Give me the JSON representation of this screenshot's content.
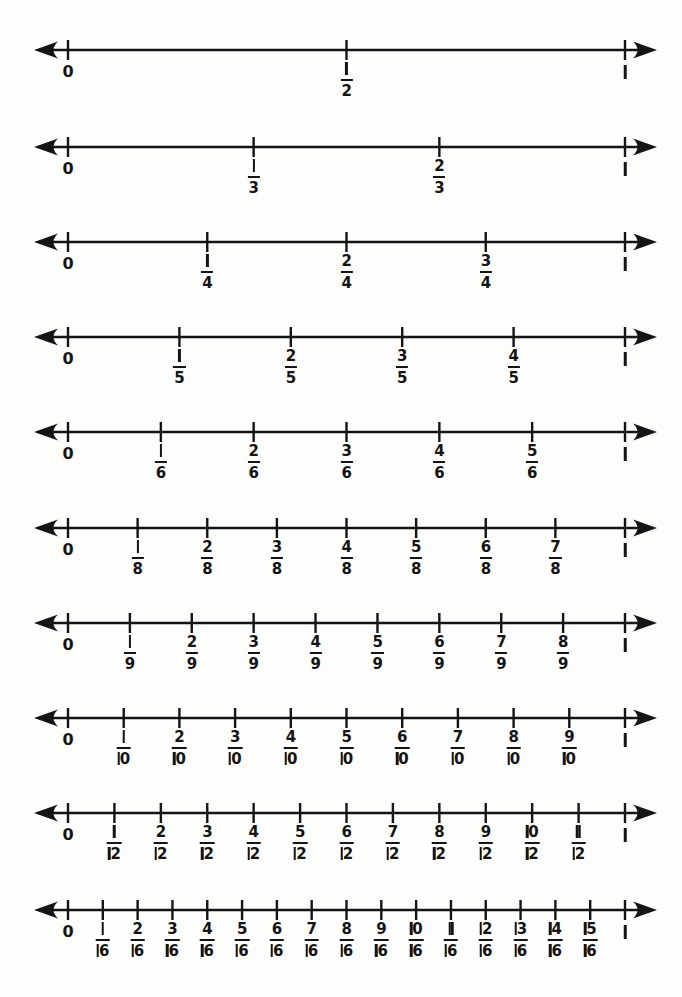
{
  "page": {
    "background_color": "#fdfdfc",
    "ink_color": "#141414",
    "width": 682,
    "height": 997
  },
  "axis": {
    "zero_label": "0",
    "one_label": "1",
    "left_arrow": "arrow-left",
    "right_arrow": "arrow-right",
    "x_zero": 68,
    "x_one": 625,
    "left_tip": 34,
    "right_tip": 657
  },
  "chart_data": {
    "type": "line",
    "xlabel": "",
    "ylabel": "",
    "xlim": [
      0,
      1
    ],
    "grid": false,
    "legend": null,
    "denominators": [
      2,
      3,
      4,
      5,
      6,
      8,
      9,
      10,
      12,
      16
    ],
    "rows": [
      {
        "denominator": 2,
        "row_index": 0,
        "axis_y": 50,
        "tick_values": [
          0,
          0.5,
          1
        ],
        "labels": [
          "0",
          "1/2",
          "1"
        ],
        "fractions": [
          {
            "numerator": "1",
            "denominator": "2",
            "value": 0.5
          }
        ]
      },
      {
        "denominator": 3,
        "row_index": 1,
        "axis_y": 147,
        "tick_values": [
          0,
          0.3333,
          0.6667,
          1
        ],
        "labels": [
          "0",
          "1/3",
          "2/3",
          "1"
        ],
        "fractions": [
          {
            "numerator": "1",
            "denominator": "3",
            "value": 0.3333
          },
          {
            "numerator": "2",
            "denominator": "3",
            "value": 0.6667
          }
        ]
      },
      {
        "denominator": 4,
        "row_index": 2,
        "axis_y": 242,
        "tick_values": [
          0,
          0.25,
          0.5,
          0.75,
          1
        ],
        "labels": [
          "0",
          "1/4",
          "2/4",
          "3/4",
          "1"
        ],
        "fractions": [
          {
            "numerator": "1",
            "denominator": "4",
            "value": 0.25
          },
          {
            "numerator": "2",
            "denominator": "4",
            "value": 0.5
          },
          {
            "numerator": "3",
            "denominator": "4",
            "value": 0.75
          }
        ]
      },
      {
        "denominator": 5,
        "row_index": 3,
        "axis_y": 337,
        "tick_values": [
          0,
          0.2,
          0.4,
          0.6,
          0.8,
          1
        ],
        "labels": [
          "0",
          "1/5",
          "2/5",
          "3/5",
          "4/5",
          "1"
        ],
        "fractions": [
          {
            "numerator": "1",
            "denominator": "5",
            "value": 0.2
          },
          {
            "numerator": "2",
            "denominator": "5",
            "value": 0.4
          },
          {
            "numerator": "3",
            "denominator": "5",
            "value": 0.6
          },
          {
            "numerator": "4",
            "denominator": "5",
            "value": 0.8
          }
        ]
      },
      {
        "denominator": 6,
        "row_index": 4,
        "axis_y": 432,
        "tick_values": [
          0,
          0.1667,
          0.3333,
          0.5,
          0.6667,
          0.8333,
          1
        ],
        "labels": [
          "0",
          "1/6",
          "2/6",
          "3/6",
          "4/6",
          "5/6",
          "1"
        ],
        "fractions": [
          {
            "numerator": "1",
            "denominator": "6",
            "value": 0.1667
          },
          {
            "numerator": "2",
            "denominator": "6",
            "value": 0.3333
          },
          {
            "numerator": "3",
            "denominator": "6",
            "value": 0.5
          },
          {
            "numerator": "4",
            "denominator": "6",
            "value": 0.6667
          },
          {
            "numerator": "5",
            "denominator": "6",
            "value": 0.8333
          }
        ]
      },
      {
        "denominator": 8,
        "row_index": 5,
        "axis_y": 528,
        "tick_values": [
          0,
          0.125,
          0.25,
          0.375,
          0.5,
          0.625,
          0.75,
          0.875,
          1
        ],
        "labels": [
          "0",
          "1/8",
          "2/8",
          "3/8",
          "4/8",
          "5/8",
          "6/8",
          "7/8",
          "1"
        ],
        "fractions": [
          {
            "numerator": "1",
            "denominator": "8",
            "value": 0.125
          },
          {
            "numerator": "2",
            "denominator": "8",
            "value": 0.25
          },
          {
            "numerator": "3",
            "denominator": "8",
            "value": 0.375
          },
          {
            "numerator": "4",
            "denominator": "8",
            "value": 0.5
          },
          {
            "numerator": "5",
            "denominator": "8",
            "value": 0.625
          },
          {
            "numerator": "6",
            "denominator": "8",
            "value": 0.75
          },
          {
            "numerator": "7",
            "denominator": "8",
            "value": 0.875
          }
        ]
      },
      {
        "denominator": 9,
        "row_index": 6,
        "axis_y": 623,
        "tick_values": [
          0,
          0.1111,
          0.2222,
          0.3333,
          0.4444,
          0.5556,
          0.6667,
          0.7778,
          0.8889,
          1
        ],
        "labels": [
          "0",
          "1/9",
          "2/9",
          "3/9",
          "4/9",
          "5/9",
          "6/9",
          "7/9",
          "8/9",
          "1"
        ],
        "fractions": [
          {
            "numerator": "1",
            "denominator": "9",
            "value": 0.1111
          },
          {
            "numerator": "2",
            "denominator": "9",
            "value": 0.2222
          },
          {
            "numerator": "3",
            "denominator": "9",
            "value": 0.3333
          },
          {
            "numerator": "4",
            "denominator": "9",
            "value": 0.4444
          },
          {
            "numerator": "5",
            "denominator": "9",
            "value": 0.5556
          },
          {
            "numerator": "6",
            "denominator": "9",
            "value": 0.6667
          },
          {
            "numerator": "7",
            "denominator": "9",
            "value": 0.7778
          },
          {
            "numerator": "8",
            "denominator": "9",
            "value": 0.8889
          }
        ]
      },
      {
        "denominator": 10,
        "row_index": 7,
        "axis_y": 718,
        "tick_values": [
          0,
          0.1,
          0.2,
          0.3,
          0.4,
          0.5,
          0.6,
          0.7,
          0.8,
          0.9,
          1
        ],
        "labels": [
          "0",
          "1/10",
          "2/10",
          "3/10",
          "4/10",
          "5/10",
          "6/10",
          "7/10",
          "8/10",
          "9/10",
          "1"
        ],
        "fractions": [
          {
            "numerator": "1",
            "denominator": "10",
            "value": 0.1
          },
          {
            "numerator": "2",
            "denominator": "10",
            "value": 0.2
          },
          {
            "numerator": "3",
            "denominator": "10",
            "value": 0.3
          },
          {
            "numerator": "4",
            "denominator": "10",
            "value": 0.4
          },
          {
            "numerator": "5",
            "denominator": "10",
            "value": 0.5
          },
          {
            "numerator": "6",
            "denominator": "10",
            "value": 0.6
          },
          {
            "numerator": "7",
            "denominator": "10",
            "value": 0.7
          },
          {
            "numerator": "8",
            "denominator": "10",
            "value": 0.8
          },
          {
            "numerator": "9",
            "denominator": "10",
            "value": 0.9
          }
        ]
      },
      {
        "denominator": 12,
        "row_index": 8,
        "axis_y": 813,
        "tick_values": [
          0,
          0.0833,
          0.1667,
          0.25,
          0.3333,
          0.4167,
          0.5,
          0.5833,
          0.6667,
          0.75,
          0.8333,
          0.9167,
          1
        ],
        "labels": [
          "0",
          "1/12",
          "2/12",
          "3/12",
          "4/12",
          "5/12",
          "6/12",
          "7/12",
          "8/12",
          "9/12",
          "10/12",
          "11/12",
          "1"
        ],
        "fractions": [
          {
            "numerator": "1",
            "denominator": "12",
            "value": 0.0833
          },
          {
            "numerator": "2",
            "denominator": "12",
            "value": 0.1667
          },
          {
            "numerator": "3",
            "denominator": "12",
            "value": 0.25
          },
          {
            "numerator": "4",
            "denominator": "12",
            "value": 0.3333
          },
          {
            "numerator": "5",
            "denominator": "12",
            "value": 0.4167
          },
          {
            "numerator": "6",
            "denominator": "12",
            "value": 0.5
          },
          {
            "numerator": "7",
            "denominator": "12",
            "value": 0.5833
          },
          {
            "numerator": "8",
            "denominator": "12",
            "value": 0.6667
          },
          {
            "numerator": "9",
            "denominator": "12",
            "value": 0.75
          },
          {
            "numerator": "10",
            "denominator": "12",
            "value": 0.8333
          },
          {
            "numerator": "11",
            "denominator": "12",
            "value": 0.9167
          }
        ]
      },
      {
        "denominator": 16,
        "row_index": 9,
        "axis_y": 910,
        "tick_values": [
          0,
          0.0625,
          0.125,
          0.1875,
          0.25,
          0.3125,
          0.375,
          0.4375,
          0.5,
          0.5625,
          0.625,
          0.6875,
          0.75,
          0.8125,
          0.875,
          0.9375,
          1
        ],
        "labels": [
          "0",
          "1/16",
          "2/16",
          "3/16",
          "4/16",
          "5/16",
          "6/16",
          "7/16",
          "8/16",
          "9/16",
          "10/16",
          "11/16",
          "12/16",
          "13/16",
          "14/16",
          "15/16",
          "1"
        ],
        "fractions": [
          {
            "numerator": "1",
            "denominator": "16",
            "value": 0.0625
          },
          {
            "numerator": "2",
            "denominator": "16",
            "value": 0.125
          },
          {
            "numerator": "3",
            "denominator": "16",
            "value": 0.1875
          },
          {
            "numerator": "4",
            "denominator": "16",
            "value": 0.25
          },
          {
            "numerator": "5",
            "denominator": "16",
            "value": 0.3125
          },
          {
            "numerator": "6",
            "denominator": "16",
            "value": 0.375
          },
          {
            "numerator": "7",
            "denominator": "16",
            "value": 0.4375
          },
          {
            "numerator": "8",
            "denominator": "16",
            "value": 0.5
          },
          {
            "numerator": "9",
            "denominator": "16",
            "value": 0.5625
          },
          {
            "numerator": "10",
            "denominator": "16",
            "value": 0.625
          },
          {
            "numerator": "11",
            "denominator": "16",
            "value": 0.6875
          },
          {
            "numerator": "12",
            "denominator": "16",
            "value": 0.75
          },
          {
            "numerator": "13",
            "denominator": "16",
            "value": 0.8125
          },
          {
            "numerator": "14",
            "denominator": "16",
            "value": 0.875
          },
          {
            "numerator": "15",
            "denominator": "16",
            "value": 0.9375
          }
        ]
      }
    ]
  }
}
